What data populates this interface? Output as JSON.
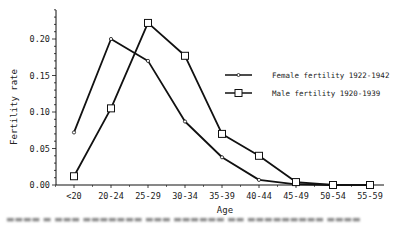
{
  "chart_data": {
    "type": "line",
    "title": "",
    "xlabel": "Age",
    "ylabel": "Fertility rate",
    "categories": [
      "<20",
      "20-24",
      "25-29",
      "30-34",
      "35-39",
      "40-44",
      "45-49",
      "50-54",
      "55-59"
    ],
    "ylim": [
      0,
      0.24
    ],
    "yticks": [
      "0.00",
      "0.05",
      "0.10",
      "0.15",
      "0.20"
    ],
    "grid": false,
    "legend_position": "upper right (inside plot)",
    "series": [
      {
        "name": "Female fertility 1922-1942",
        "marker": "small-diamond",
        "values": [
          0.072,
          0.2,
          0.17,
          0.087,
          0.038,
          0.007,
          0.001,
          0.0,
          null
        ]
      },
      {
        "name": "Male fertility 1920-1939",
        "marker": "open-square",
        "values": [
          0.012,
          0.105,
          0.222,
          0.177,
          0.07,
          0.04,
          0.004,
          0.0,
          0.0
        ]
      }
    ]
  },
  "colors": {
    "line": "#111111",
    "background": "#ffffff"
  }
}
